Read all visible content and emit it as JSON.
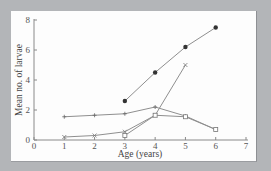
{
  "chart_data": {
    "type": "line",
    "title": "",
    "xlabel": "Age (years)",
    "ylabel": "Mean no. of larvae",
    "xlim": [
      0,
      7
    ],
    "ylim": [
      0,
      8
    ],
    "x_ticks": [
      0,
      1,
      2,
      3,
      4,
      5,
      6,
      7
    ],
    "y_ticks": [
      0,
      2,
      4,
      6,
      8
    ],
    "grid": false,
    "legend": null,
    "series": [
      {
        "name": "filled-circle series",
        "marker": "filled-circle",
        "x": [
          3,
          4,
          5,
          6
        ],
        "values": [
          2.6,
          4.5,
          6.2,
          7.5
        ]
      },
      {
        "name": "plus series",
        "marker": "plus",
        "x": [
          1,
          2,
          3,
          4,
          5,
          6
        ],
        "values": [
          1.55,
          1.65,
          1.75,
          2.2,
          1.6,
          0.7
        ]
      },
      {
        "name": "cross series",
        "marker": "cross",
        "x": [
          1,
          2,
          3,
          4,
          5
        ],
        "values": [
          0.2,
          0.3,
          0.55,
          1.65,
          5.0
        ]
      },
      {
        "name": "open-square series",
        "marker": "open-square",
        "x": [
          3,
          4,
          5,
          6
        ],
        "values": [
          0.3,
          1.65,
          1.55,
          0.7
        ]
      }
    ]
  },
  "colors": {
    "background": "#b3b5b8",
    "panel": "#fdfdfd",
    "axis": "#8a8a8a",
    "line": "#8f8f8f",
    "marker": "#333333"
  }
}
